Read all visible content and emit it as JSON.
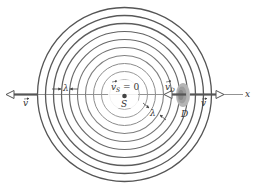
{
  "diagram": {
    "type": "doppler-effect-wavefronts",
    "center": {
      "x": 124.5,
      "y": 94.5
    },
    "wavefront_radii": [
      87,
      79,
      71,
      63,
      55,
      47,
      39,
      31,
      23,
      15
    ],
    "colors": {
      "outer_wavefront": "#555555",
      "inner_wavefront": "#9a9a9a",
      "axis": "#666666",
      "detector": "#a8a8a8",
      "arrow": "#555555"
    },
    "labels": {
      "source_velocity": "v",
      "source_velocity_sub": "S",
      "source_velocity_eq": " = 0",
      "source": "S",
      "detector_velocity": "v",
      "detector_velocity_sub": "D",
      "detector": "D",
      "wave_velocity_left": "v",
      "wave_velocity_right": "v",
      "wavelength_horizontal": "λ",
      "wavelength_diagonal": "λ",
      "axis": "x"
    }
  }
}
